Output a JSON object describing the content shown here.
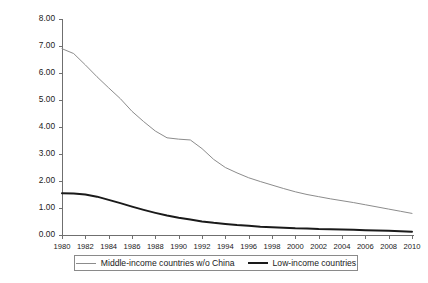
{
  "chart_data": {
    "type": "line",
    "title": "",
    "subtitle": "",
    "xlabel": "",
    "ylabel": "",
    "xlim": [
      1980,
      2010
    ],
    "ylim": [
      0,
      8
    ],
    "grid": false,
    "legend_position": "bottom",
    "y_ticks": [
      "0.00",
      "1.00",
      "2.00",
      "3.00",
      "4.00",
      "5.00",
      "6.00",
      "7.00",
      "8.00"
    ],
    "y_tick_values": [
      0,
      1,
      2,
      3,
      4,
      5,
      6,
      7,
      8
    ],
    "x_tick_labels": [
      "1980",
      "1982",
      "1984",
      "1986",
      "1988",
      "1990",
      "1992",
      "1994",
      "1996",
      "1998",
      "2000",
      "2002",
      "2004",
      "2006",
      "2008",
      "2010"
    ],
    "x_tick_values": [
      1980,
      1982,
      1984,
      1986,
      1988,
      1990,
      1992,
      1994,
      1996,
      1998,
      2000,
      2002,
      2004,
      2006,
      2008,
      2010
    ],
    "x": [
      1980,
      1981,
      1982,
      1983,
      1984,
      1985,
      1986,
      1987,
      1988,
      1989,
      1990,
      1991,
      1992,
      1993,
      1994,
      1995,
      1996,
      1997,
      1998,
      1999,
      2000,
      2001,
      2002,
      2003,
      2004,
      2005,
      2006,
      2007,
      2008,
      2009,
      2010
    ],
    "series": [
      {
        "name": "Middle-income countries w/o China",
        "color": "#8c8c8c",
        "width": 1.0,
        "values": [
          6.9,
          6.72,
          6.3,
          5.86,
          5.45,
          5.05,
          4.58,
          4.2,
          3.85,
          3.6,
          3.55,
          3.52,
          3.2,
          2.8,
          2.5,
          2.3,
          2.12,
          1.98,
          1.85,
          1.72,
          1.6,
          1.5,
          1.42,
          1.34,
          1.27,
          1.2,
          1.12,
          1.04,
          0.96,
          0.88,
          0.8
        ]
      },
      {
        "name": "Low-income countries",
        "color": "#1a1a1a",
        "width": 2.0,
        "values": [
          1.55,
          1.54,
          1.5,
          1.42,
          1.3,
          1.18,
          1.05,
          0.93,
          0.82,
          0.72,
          0.64,
          0.57,
          0.5,
          0.45,
          0.41,
          0.37,
          0.34,
          0.31,
          0.29,
          0.27,
          0.25,
          0.24,
          0.22,
          0.21,
          0.2,
          0.19,
          0.18,
          0.17,
          0.16,
          0.14,
          0.12
        ]
      }
    ]
  },
  "legend": {
    "entries": [
      {
        "label": "Middle-income countries w/o China",
        "color": "#8c8c8c",
        "width": 1.0
      },
      {
        "label": "Low-income countries",
        "color": "#1a1a1a",
        "width": 2.0
      }
    ]
  }
}
